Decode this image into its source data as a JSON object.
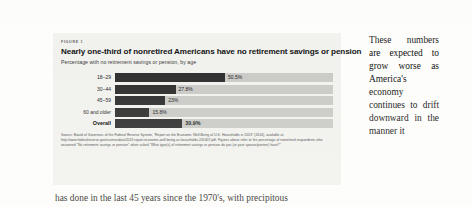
{
  "figure": {
    "figure_label": "FIGURE 1",
    "title": "Nearly one-third of nonretired Americans have no retirement savings or pension",
    "subtitle": "Percentage with no retirement savings or pension, by age",
    "source_note": "Source: Board of Governors of the Federal Reserve System, \"Report on the Economic Well-Being of U.S. Households in 2013\" (2014), available at http://www.federalreserve.gov/econresdata/2013-report-economic-well-being-us-households-201407.pdf. Figures above refer to the percentage of nonretired respondents who answered \"No retirement savings or pension\" when asked \"What type(s) of retirement savings or pension do you (or your spouse/partner) have?\""
  },
  "chart_data": {
    "type": "bar",
    "orientation": "horizontal",
    "title": "Nearly one-third of nonretired Americans have no retirement savings or pension",
    "subtitle": "Percentage with no retirement savings or pension, by age",
    "xlabel": "",
    "ylabel": "",
    "xlim": [
      0,
      100
    ],
    "grid": false,
    "legend": false,
    "bar_color": "#2b2b2b",
    "track_color": "#c9c9c6",
    "categories": [
      "18–29",
      "30–44",
      "45–59",
      "60 and older",
      "Overall"
    ],
    "values": [
      50.5,
      27.8,
      23,
      15.8,
      30.9
    ],
    "value_labels": [
      "50.5%",
      "27.8%",
      "23%",
      "15.8%",
      "30.9%"
    ],
    "emphasis_index": 4
  },
  "body_text": {
    "right_column": "These numbers are expected to grow worse as America's economy continues to drift downward in the manner it",
    "bottom_line": "has done in the last 45 years since the 1970's, with precipitous"
  }
}
